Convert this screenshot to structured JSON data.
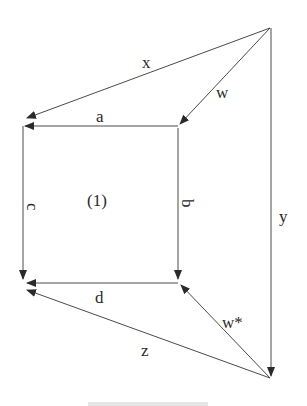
{
  "diagram": {
    "type": "commutative-diagram",
    "region_label": "(1)",
    "nodes": [
      {
        "id": "apex_top",
        "x": 270,
        "y": 28
      },
      {
        "id": "top_left",
        "x": 25,
        "y": 126
      },
      {
        "id": "top_mid",
        "x": 178,
        "y": 126
      },
      {
        "id": "bottom_left",
        "x": 25,
        "y": 283
      },
      {
        "id": "bottom_mid",
        "x": 178,
        "y": 283
      },
      {
        "id": "apex_bottom",
        "x": 272,
        "y": 378
      }
    ],
    "edges": [
      {
        "label": "x",
        "from": "apex_top",
        "to": "top_left"
      },
      {
        "label": "w",
        "from": "apex_top",
        "to": "top_mid"
      },
      {
        "label": "a",
        "from": "top_mid",
        "to": "top_left"
      },
      {
        "label": "c",
        "from": "top_left",
        "to": "bottom_left"
      },
      {
        "label": "b",
        "from": "top_mid",
        "to": "bottom_mid"
      },
      {
        "label": "y",
        "from": "apex_top",
        "to": "apex_bottom"
      },
      {
        "label": "d",
        "from": "bottom_mid",
        "to": "bottom_left"
      },
      {
        "label": "w*",
        "from": "apex_bottom",
        "to": "bottom_mid"
      },
      {
        "label": "z",
        "from": "apex_bottom",
        "to": "bottom_left"
      }
    ],
    "labels": {
      "x": "x",
      "w": "w",
      "a": "a",
      "c": "c",
      "b": "b",
      "y": "y",
      "d": "d",
      "w_star": "w*",
      "z": "z",
      "region": "(1)"
    }
  }
}
